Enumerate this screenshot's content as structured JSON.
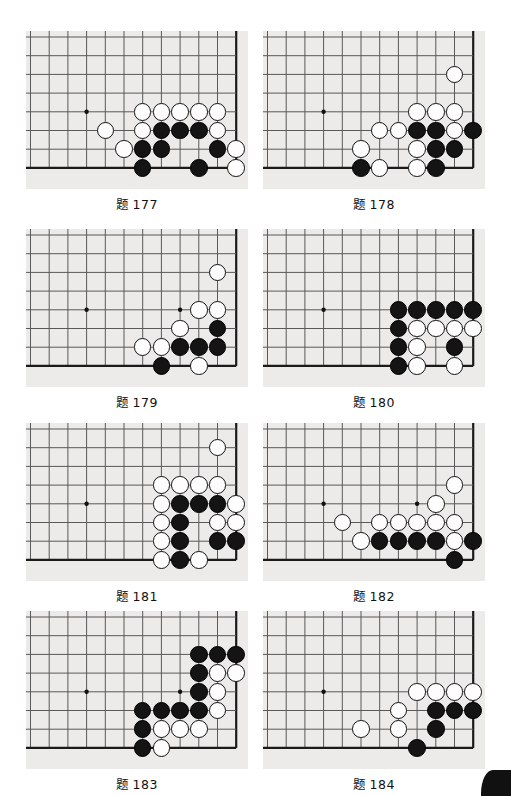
{
  "page": {
    "board_bg_color": "#edebe9",
    "line_color": "#595959",
    "edge_color": "#1a1a1a",
    "black_stone_color": "#141414",
    "white_stone_color": "#fdfdfd",
    "corner_mark": "page-corner-mark"
  },
  "board_geometry": {
    "panel_width": 218,
    "panel_height": 158,
    "cell": 18.7,
    "origin_x": 4.5,
    "origin_y": 6.0,
    "cols": 12,
    "rows": 8,
    "note": "col index 0 = leftmost vertical line; row index 0 = topmost horizontal line; right edge col 11 and bottom edge row 7 are the board boundary lines"
  },
  "problems": [
    {
      "id": "177",
      "label": "题",
      "number": "177",
      "panel": {
        "left": 26,
        "top": 31,
        "width": 222,
        "height": 158
      },
      "star_points": [
        {
          "c": 3,
          "r": 4
        }
      ],
      "edges": {
        "right": 11,
        "bottom": 7
      },
      "stones": [
        {
          "color": "white",
          "c": 6,
          "r": 4
        },
        {
          "color": "white",
          "c": 7,
          "r": 4
        },
        {
          "color": "white",
          "c": 8,
          "r": 4
        },
        {
          "color": "white",
          "c": 9,
          "r": 4
        },
        {
          "color": "white",
          "c": 10,
          "r": 4
        },
        {
          "color": "white",
          "c": 4,
          "r": 5
        },
        {
          "color": "white",
          "c": 6,
          "r": 5
        },
        {
          "color": "black",
          "c": 7,
          "r": 5
        },
        {
          "color": "black",
          "c": 8,
          "r": 5
        },
        {
          "color": "black",
          "c": 9,
          "r": 5
        },
        {
          "color": "white",
          "c": 10,
          "r": 5
        },
        {
          "color": "white",
          "c": 5,
          "r": 6
        },
        {
          "color": "black",
          "c": 6,
          "r": 6
        },
        {
          "color": "black",
          "c": 7,
          "r": 6
        },
        {
          "color": "black",
          "c": 10,
          "r": 6
        },
        {
          "color": "white",
          "c": 11,
          "r": 6
        },
        {
          "color": "black",
          "c": 6,
          "r": 7
        },
        {
          "color": "black",
          "c": 9,
          "r": 7
        },
        {
          "color": "white",
          "c": 11,
          "r": 7
        }
      ]
    },
    {
      "id": "178",
      "label": "题",
      "number": "178",
      "panel": {
        "left": 263,
        "top": 31,
        "width": 222,
        "height": 158
      },
      "star_points": [
        {
          "c": 3,
          "r": 4
        }
      ],
      "edges": {
        "right": 11,
        "bottom": 7
      },
      "stones": [
        {
          "color": "white",
          "c": 10,
          "r": 2
        },
        {
          "color": "white",
          "c": 8,
          "r": 4
        },
        {
          "color": "white",
          "c": 9,
          "r": 4
        },
        {
          "color": "white",
          "c": 10,
          "r": 4
        },
        {
          "color": "white",
          "c": 6,
          "r": 5
        },
        {
          "color": "white",
          "c": 7,
          "r": 5
        },
        {
          "color": "black",
          "c": 8,
          "r": 5
        },
        {
          "color": "black",
          "c": 9,
          "r": 5
        },
        {
          "color": "white",
          "c": 10,
          "r": 5
        },
        {
          "color": "black",
          "c": 11,
          "r": 5
        },
        {
          "color": "white",
          "c": 5,
          "r": 6
        },
        {
          "color": "white",
          "c": 8,
          "r": 6
        },
        {
          "color": "black",
          "c": 9,
          "r": 6
        },
        {
          "color": "black",
          "c": 10,
          "r": 6
        },
        {
          "color": "black",
          "c": 5,
          "r": 7
        },
        {
          "color": "white",
          "c": 6,
          "r": 7
        },
        {
          "color": "white",
          "c": 8,
          "r": 7
        },
        {
          "color": "black",
          "c": 9,
          "r": 7
        }
      ]
    },
    {
      "id": "179",
      "label": "题",
      "number": "179",
      "panel": {
        "left": 26,
        "top": 229,
        "width": 222,
        "height": 158
      },
      "star_points": [
        {
          "c": 3,
          "r": 4
        },
        {
          "c": 8,
          "r": 4
        }
      ],
      "edges": {
        "right": 11,
        "bottom": 7
      },
      "stones": [
        {
          "color": "white",
          "c": 10,
          "r": 2
        },
        {
          "color": "white",
          "c": 9,
          "r": 4
        },
        {
          "color": "white",
          "c": 10,
          "r": 4
        },
        {
          "color": "white",
          "c": 8,
          "r": 5
        },
        {
          "color": "black",
          "c": 10,
          "r": 5
        },
        {
          "color": "white",
          "c": 6,
          "r": 6
        },
        {
          "color": "white",
          "c": 7,
          "r": 6
        },
        {
          "color": "black",
          "c": 8,
          "r": 6
        },
        {
          "color": "black",
          "c": 9,
          "r": 6
        },
        {
          "color": "black",
          "c": 10,
          "r": 6
        },
        {
          "color": "black",
          "c": 7,
          "r": 7
        },
        {
          "color": "white",
          "c": 9,
          "r": 7
        }
      ]
    },
    {
      "id": "180",
      "label": "题",
      "number": "180",
      "panel": {
        "left": 263,
        "top": 229,
        "width": 222,
        "height": 158
      },
      "star_points": [
        {
          "c": 3,
          "r": 4
        }
      ],
      "edges": {
        "right": 11,
        "bottom": 7
      },
      "stones": [
        {
          "color": "black",
          "c": 7,
          "r": 4
        },
        {
          "color": "black",
          "c": 8,
          "r": 4
        },
        {
          "color": "black",
          "c": 9,
          "r": 4
        },
        {
          "color": "black",
          "c": 10,
          "r": 4
        },
        {
          "color": "black",
          "c": 11,
          "r": 4
        },
        {
          "color": "black",
          "c": 7,
          "r": 5
        },
        {
          "color": "white",
          "c": 8,
          "r": 5
        },
        {
          "color": "white",
          "c": 9,
          "r": 5
        },
        {
          "color": "white",
          "c": 10,
          "r": 5
        },
        {
          "color": "white",
          "c": 11,
          "r": 5
        },
        {
          "color": "black",
          "c": 7,
          "r": 6
        },
        {
          "color": "white",
          "c": 8,
          "r": 6
        },
        {
          "color": "black",
          "c": 10,
          "r": 6
        },
        {
          "color": "black",
          "c": 7,
          "r": 7
        },
        {
          "color": "white",
          "c": 8,
          "r": 7
        },
        {
          "color": "white",
          "c": 10,
          "r": 7
        }
      ]
    },
    {
      "id": "181",
      "label": "题",
      "number": "181",
      "panel": {
        "left": 26,
        "top": 423,
        "width": 222,
        "height": 158
      },
      "star_points": [
        {
          "c": 3,
          "r": 4
        }
      ],
      "edges": {
        "right": 11,
        "bottom": 7
      },
      "stones": [
        {
          "color": "white",
          "c": 10,
          "r": 1
        },
        {
          "color": "white",
          "c": 7,
          "r": 3
        },
        {
          "color": "white",
          "c": 8,
          "r": 3
        },
        {
          "color": "white",
          "c": 9,
          "r": 3
        },
        {
          "color": "white",
          "c": 10,
          "r": 3
        },
        {
          "color": "white",
          "c": 7,
          "r": 4
        },
        {
          "color": "black",
          "c": 8,
          "r": 4
        },
        {
          "color": "black",
          "c": 9,
          "r": 4
        },
        {
          "color": "black",
          "c": 10,
          "r": 4
        },
        {
          "color": "white",
          "c": 11,
          "r": 4
        },
        {
          "color": "white",
          "c": 7,
          "r": 5
        },
        {
          "color": "black",
          "c": 8,
          "r": 5
        },
        {
          "color": "white",
          "c": 10,
          "r": 5
        },
        {
          "color": "white",
          "c": 11,
          "r": 5
        },
        {
          "color": "white",
          "c": 7,
          "r": 6
        },
        {
          "color": "black",
          "c": 8,
          "r": 6
        },
        {
          "color": "black",
          "c": 10,
          "r": 6
        },
        {
          "color": "black",
          "c": 11,
          "r": 6
        },
        {
          "color": "white",
          "c": 7,
          "r": 7
        },
        {
          "color": "black",
          "c": 8,
          "r": 7
        },
        {
          "color": "white",
          "c": 9,
          "r": 7
        }
      ]
    },
    {
      "id": "182",
      "label": "题",
      "number": "182",
      "panel": {
        "left": 263,
        "top": 423,
        "width": 222,
        "height": 158
      },
      "star_points": [
        {
          "c": 3,
          "r": 4
        },
        {
          "c": 8,
          "r": 4
        }
      ],
      "edges": {
        "right": 11,
        "bottom": 7
      },
      "stones": [
        {
          "color": "white",
          "c": 10,
          "r": 3
        },
        {
          "color": "white",
          "c": 9,
          "r": 4
        },
        {
          "color": "white",
          "c": 4,
          "r": 5
        },
        {
          "color": "white",
          "c": 6,
          "r": 5
        },
        {
          "color": "white",
          "c": 7,
          "r": 5
        },
        {
          "color": "white",
          "c": 8,
          "r": 5
        },
        {
          "color": "white",
          "c": 9,
          "r": 5
        },
        {
          "color": "white",
          "c": 10,
          "r": 5
        },
        {
          "color": "white",
          "c": 5,
          "r": 6
        },
        {
          "color": "black",
          "c": 6,
          "r": 6
        },
        {
          "color": "black",
          "c": 7,
          "r": 6
        },
        {
          "color": "black",
          "c": 8,
          "r": 6
        },
        {
          "color": "black",
          "c": 9,
          "r": 6
        },
        {
          "color": "white",
          "c": 10,
          "r": 6
        },
        {
          "color": "black",
          "c": 11,
          "r": 6
        },
        {
          "color": "black",
          "c": 10,
          "r": 7
        }
      ]
    },
    {
      "id": "183",
      "label": "题",
      "number": "183",
      "panel": {
        "left": 26,
        "top": 611,
        "width": 222,
        "height": 158
      },
      "star_points": [
        {
          "c": 3,
          "r": 4
        },
        {
          "c": 8,
          "r": 4
        }
      ],
      "edges": {
        "right": 11,
        "bottom": 7
      },
      "stones": [
        {
          "color": "black",
          "c": 9,
          "r": 2
        },
        {
          "color": "black",
          "c": 10,
          "r": 2
        },
        {
          "color": "black",
          "c": 11,
          "r": 2
        },
        {
          "color": "black",
          "c": 9,
          "r": 3
        },
        {
          "color": "white",
          "c": 10,
          "r": 3
        },
        {
          "color": "white",
          "c": 11,
          "r": 3
        },
        {
          "color": "black",
          "c": 9,
          "r": 4
        },
        {
          "color": "white",
          "c": 10,
          "r": 4
        },
        {
          "color": "black",
          "c": 6,
          "r": 5
        },
        {
          "color": "black",
          "c": 7,
          "r": 5
        },
        {
          "color": "black",
          "c": 8,
          "r": 5
        },
        {
          "color": "black",
          "c": 9,
          "r": 5
        },
        {
          "color": "white",
          "c": 10,
          "r": 5
        },
        {
          "color": "black",
          "c": 6,
          "r": 6
        },
        {
          "color": "white",
          "c": 7,
          "r": 6
        },
        {
          "color": "white",
          "c": 8,
          "r": 6
        },
        {
          "color": "white",
          "c": 9,
          "r": 6
        },
        {
          "color": "black",
          "c": 6,
          "r": 7
        },
        {
          "color": "white",
          "c": 7,
          "r": 7
        }
      ]
    },
    {
      "id": "184",
      "label": "题",
      "number": "184",
      "panel": {
        "left": 263,
        "top": 611,
        "width": 222,
        "height": 158
      },
      "star_points": [
        {
          "c": 3,
          "r": 4
        }
      ],
      "edges": {
        "right": 11,
        "bottom": 7
      },
      "stones": [
        {
          "color": "white",
          "c": 8,
          "r": 4
        },
        {
          "color": "white",
          "c": 9,
          "r": 4
        },
        {
          "color": "white",
          "c": 10,
          "r": 4
        },
        {
          "color": "white",
          "c": 11,
          "r": 4
        },
        {
          "color": "white",
          "c": 7,
          "r": 5
        },
        {
          "color": "black",
          "c": 9,
          "r": 5
        },
        {
          "color": "black",
          "c": 10,
          "r": 5
        },
        {
          "color": "black",
          "c": 11,
          "r": 5
        },
        {
          "color": "white",
          "c": 5,
          "r": 6
        },
        {
          "color": "white",
          "c": 7,
          "r": 6
        },
        {
          "color": "black",
          "c": 9,
          "r": 6
        },
        {
          "color": "black",
          "c": 8,
          "r": 7
        }
      ]
    }
  ]
}
